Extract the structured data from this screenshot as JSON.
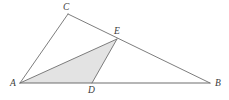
{
  "figure": {
    "type": "geometry-diagram",
    "width": 229,
    "height": 100,
    "background_color": "#ffffff",
    "stroke_color": "#6e6e6e",
    "stroke_width": 0.9,
    "shade_color": "#e3e3e3",
    "shade_stroke_color": "#6e6e6e",
    "label_color": "#3a3a3a"
  },
  "points": {
    "A": {
      "label": "A",
      "x": 20,
      "y": 83,
      "label_x": 10,
      "label_y": 79
    },
    "B": {
      "label": "B",
      "x": 210,
      "y": 83,
      "label_x": 215,
      "label_y": 79
    },
    "C": {
      "label": "C",
      "x": 68,
      "y": 14,
      "label_x": 63,
      "label_y": 3
    },
    "D": {
      "label": "D",
      "x": 92,
      "y": 83,
      "label_x": 88,
      "label_y": 86
    },
    "E": {
      "label": "E",
      "x": 117,
      "y": 39,
      "label_x": 114,
      "label_y": 27
    }
  },
  "segments": [
    {
      "name": "segment-AB",
      "from": "A",
      "to": "B",
      "x1": 20,
      "y1": 83,
      "x2": 210,
      "y2": 83
    },
    {
      "name": "segment-AC",
      "from": "A",
      "to": "C",
      "x1": 20,
      "y1": 83,
      "x2": 68,
      "y2": 14
    },
    {
      "name": "segment-CB",
      "from": "C",
      "to": "B",
      "x1": 68,
      "y1": 14,
      "x2": 210,
      "y2": 83
    },
    {
      "name": "segment-AE",
      "from": "A",
      "to": "E",
      "x1": 20,
      "y1": 83,
      "x2": 117,
      "y2": 39
    },
    {
      "name": "segment-DE",
      "from": "D",
      "to": "E",
      "x1": 92,
      "y1": 83,
      "x2": 117,
      "y2": 39
    }
  ],
  "shaded_region": {
    "name": "triangle-ADE",
    "vertices": "A,D,E",
    "polygon_points": "20,83 92,83 117,39",
    "fill": "#e3e3e3"
  }
}
